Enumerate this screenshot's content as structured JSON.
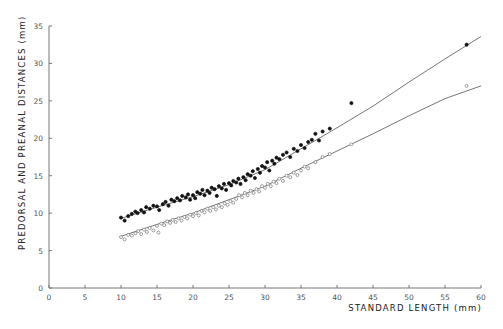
{
  "chart_data": {
    "type": "scatter",
    "title": "",
    "xlabel": "STANDARD LENGTH (mm)",
    "ylabel": "PREDORSAL AND PREANAL DISTANCES (mm)",
    "xlim": [
      0,
      60
    ],
    "ylim": [
      0,
      35
    ],
    "x_ticks": [
      0,
      5,
      10,
      15,
      20,
      25,
      30,
      35,
      40,
      45,
      50,
      55,
      60
    ],
    "y_ticks": [
      0,
      5,
      10,
      15,
      20,
      25,
      30,
      35
    ],
    "grid": false,
    "legend": null,
    "series": [
      {
        "name": "Predorsal distance",
        "marker": "filled-circle",
        "fit_line": [
          [
            10,
            9.3
          ],
          [
            15,
            10.8
          ],
          [
            20,
            12.2
          ],
          [
            25,
            13.8
          ],
          [
            30,
            15.8
          ],
          [
            35,
            18.6
          ],
          [
            40,
            21.4
          ],
          [
            45,
            24.3
          ],
          [
            50,
            27.5
          ],
          [
            55,
            30.6
          ],
          [
            60,
            33.6
          ]
        ],
        "points": [
          [
            10,
            9.4
          ],
          [
            10.5,
            9.0
          ],
          [
            11,
            9.6
          ],
          [
            11.5,
            9.9
          ],
          [
            12,
            10.2
          ],
          [
            12.3,
            10.0
          ],
          [
            12.8,
            10.4
          ],
          [
            13.2,
            10.1
          ],
          [
            13.5,
            10.8
          ],
          [
            14,
            10.6
          ],
          [
            14.5,
            11.0
          ],
          [
            15,
            10.9
          ],
          [
            15.3,
            10.4
          ],
          [
            15.8,
            11.2
          ],
          [
            16.2,
            11.5
          ],
          [
            16.6,
            11.0
          ],
          [
            17,
            11.8
          ],
          [
            17.4,
            11.6
          ],
          [
            17.8,
            12.0
          ],
          [
            18.2,
            11.7
          ],
          [
            18.5,
            12.3
          ],
          [
            19,
            12.1
          ],
          [
            19.3,
            12.5
          ],
          [
            19.6,
            11.8
          ],
          [
            20,
            12.4
          ],
          [
            20.3,
            12.0
          ],
          [
            20.6,
            12.8
          ],
          [
            21,
            12.6
          ],
          [
            21.3,
            13.1
          ],
          [
            21.6,
            12.4
          ],
          [
            22,
            13.0
          ],
          [
            22.3,
            12.7
          ],
          [
            22.6,
            13.4
          ],
          [
            23,
            13.2
          ],
          [
            23.3,
            12.3
          ],
          [
            23.6,
            13.6
          ],
          [
            24,
            13.3
          ],
          [
            24.3,
            13.9
          ],
          [
            24.6,
            13.1
          ],
          [
            25,
            14.0
          ],
          [
            25.3,
            13.7
          ],
          [
            25.6,
            14.3
          ],
          [
            26,
            14.1
          ],
          [
            26.3,
            14.6
          ],
          [
            26.6,
            13.9
          ],
          [
            27,
            14.8
          ],
          [
            27.3,
            14.4
          ],
          [
            27.6,
            15.2
          ],
          [
            28,
            15.0
          ],
          [
            28.3,
            15.6
          ],
          [
            28.6,
            14.7
          ],
          [
            29,
            15.9
          ],
          [
            29.3,
            15.4
          ],
          [
            29.6,
            16.3
          ],
          [
            30,
            16.1
          ],
          [
            30.3,
            16.8
          ],
          [
            30.6,
            15.7
          ],
          [
            31,
            17.0
          ],
          [
            31.3,
            16.6
          ],
          [
            31.6,
            17.4
          ],
          [
            32,
            17.2
          ],
          [
            32.5,
            17.8
          ],
          [
            33,
            18.1
          ],
          [
            33.5,
            17.5
          ],
          [
            34,
            18.6
          ],
          [
            34.5,
            18.3
          ],
          [
            35,
            19.1
          ],
          [
            35.5,
            18.7
          ],
          [
            36,
            19.5
          ],
          [
            36.5,
            19.8
          ],
          [
            37,
            20.6
          ],
          [
            38,
            20.9
          ],
          [
            39,
            21.3
          ],
          [
            37.5,
            19.7
          ],
          [
            42,
            24.7
          ],
          [
            58,
            32.5
          ]
        ]
      },
      {
        "name": "Preanal distance",
        "marker": "open-circle",
        "fit_line": [
          [
            10,
            6.9
          ],
          [
            15,
            8.5
          ],
          [
            20,
            10.0
          ],
          [
            25,
            11.8
          ],
          [
            30,
            13.6
          ],
          [
            35,
            16.0
          ],
          [
            40,
            18.3
          ],
          [
            45,
            20.6
          ],
          [
            50,
            23.0
          ],
          [
            55,
            25.3
          ],
          [
            60,
            27.0
          ]
        ],
        "points": [
          [
            10,
            6.8
          ],
          [
            10.5,
            6.5
          ],
          [
            11,
            7.1
          ],
          [
            11.5,
            7.0
          ],
          [
            12,
            7.3
          ],
          [
            12.4,
            7.6
          ],
          [
            12.8,
            7.2
          ],
          [
            13.2,
            7.8
          ],
          [
            13.6,
            7.5
          ],
          [
            14,
            8.0
          ],
          [
            14.5,
            7.7
          ],
          [
            15,
            8.3
          ],
          [
            15.2,
            7.4
          ],
          [
            15.6,
            8.6
          ],
          [
            16,
            8.4
          ],
          [
            16.4,
            8.9
          ],
          [
            16.8,
            8.7
          ],
          [
            17.2,
            9.1
          ],
          [
            17.6,
            8.8
          ],
          [
            18,
            9.3
          ],
          [
            18.4,
            9.0
          ],
          [
            18.8,
            9.5
          ],
          [
            19.2,
            9.3
          ],
          [
            19.6,
            9.8
          ],
          [
            20,
            9.6
          ],
          [
            20.4,
            10.0
          ],
          [
            20.8,
            9.7
          ],
          [
            21.2,
            10.3
          ],
          [
            21.6,
            10.1
          ],
          [
            22,
            10.6
          ],
          [
            22.4,
            10.3
          ],
          [
            22.8,
            10.8
          ],
          [
            23.2,
            10.5
          ],
          [
            23.6,
            11.0
          ],
          [
            24,
            10.8
          ],
          [
            24.4,
            11.3
          ],
          [
            24.8,
            11.1
          ],
          [
            25.2,
            11.6
          ],
          [
            25.6,
            11.4
          ],
          [
            26,
            11.9
          ],
          [
            26.4,
            12.4
          ],
          [
            26.8,
            12.1
          ],
          [
            27.2,
            12.7
          ],
          [
            27.6,
            12.4
          ],
          [
            28,
            13.0
          ],
          [
            28.4,
            12.7
          ],
          [
            28.8,
            13.2
          ],
          [
            29.2,
            12.9
          ],
          [
            29.6,
            13.6
          ],
          [
            30,
            13.4
          ],
          [
            30.4,
            13.9
          ],
          [
            30.8,
            13.6
          ],
          [
            31.2,
            14.2
          ],
          [
            31.6,
            14.0
          ],
          [
            32,
            14.6
          ],
          [
            32.5,
            14.3
          ],
          [
            33,
            15.0
          ],
          [
            33.5,
            14.8
          ],
          [
            34,
            15.4
          ],
          [
            34.5,
            15.1
          ],
          [
            35,
            15.7
          ],
          [
            35.5,
            16.2
          ],
          [
            36,
            16.0
          ],
          [
            37,
            16.8
          ],
          [
            38,
            17.5
          ],
          [
            39,
            17.9
          ],
          [
            42,
            19.2
          ],
          [
            58,
            27.0
          ]
        ]
      }
    ]
  }
}
